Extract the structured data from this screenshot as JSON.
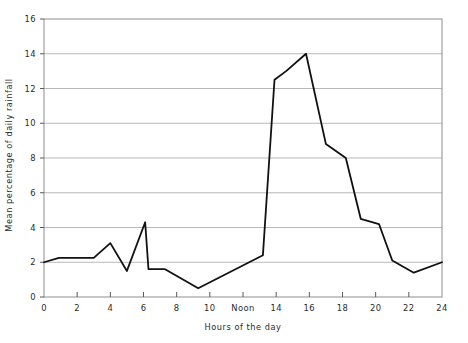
{
  "chart_data": {
    "type": "line",
    "title": "",
    "xlabel": "Hours of the day",
    "ylabel": "Mean percentage of daily rainfall",
    "xlim": [
      0,
      24
    ],
    "ylim": [
      0,
      16
    ],
    "grid": true,
    "grid_axis": "y",
    "legend": false,
    "xticks": [
      0,
      2,
      4,
      6,
      8,
      10,
      12,
      14,
      16,
      18,
      20,
      22,
      24
    ],
    "xticklabels": [
      "0",
      "2",
      "4",
      "6",
      "8",
      "10",
      "Noon",
      "14",
      "16",
      "18",
      "20",
      "22",
      "24"
    ],
    "yticks": [
      0,
      2,
      4,
      6,
      8,
      10,
      12,
      14,
      16
    ],
    "yticklabels": [
      "0",
      "2",
      "4",
      "6",
      "8",
      "10",
      "12",
      "14",
      "16"
    ],
    "series": [
      {
        "name": "Mean percentage of daily rainfall",
        "color": "#111111",
        "x": [
          0.0,
          0.9,
          3.0,
          4.0,
          5.0,
          6.1,
          6.3,
          7.3,
          9.3,
          13.2,
          13.9,
          14.6,
          15.8,
          17.0,
          18.2,
          19.1,
          20.2,
          21.0,
          22.3,
          24.0
        ],
        "y": [
          2.0,
          2.25,
          2.25,
          3.1,
          1.5,
          4.3,
          1.6,
          1.6,
          0.5,
          2.4,
          12.5,
          13.0,
          14.0,
          8.8,
          8.0,
          4.5,
          4.2,
          2.1,
          1.4,
          2.0
        ]
      }
    ]
  },
  "axes": {
    "y_axis_title": "Mean percentage of daily rainfall",
    "x_axis_title": "Hours of the day"
  }
}
